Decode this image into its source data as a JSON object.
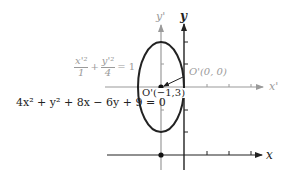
{
  "diagram": {
    "type": "ellipse-translation-of-axes",
    "colors": {
      "original_axes": "#222222",
      "translated_axes": "#9a9a9a",
      "ellipse": "#222222",
      "translated_labels": "#9a9a9a"
    },
    "axes": {
      "x_label": "x",
      "y_label": "y",
      "x_prime_label": "x'",
      "y_prime_label": "y'"
    },
    "labels": {
      "origin_prime_new": "O'(0, 0)",
      "origin_prime_old": "O'(−1,3)"
    },
    "equations": {
      "standard_form": {
        "term1_num": "x'²",
        "term1_den": "1",
        "plus": "+",
        "term2_num": "y'²",
        "term2_den": "4",
        "rhs": "= 1"
      },
      "general_form": "4x² + y² + 8x − 6y + 9 = 0"
    },
    "ellipse": {
      "center": [
        -1,
        3
      ],
      "semi_axis_x": 1,
      "semi_axis_y": 2
    }
  }
}
